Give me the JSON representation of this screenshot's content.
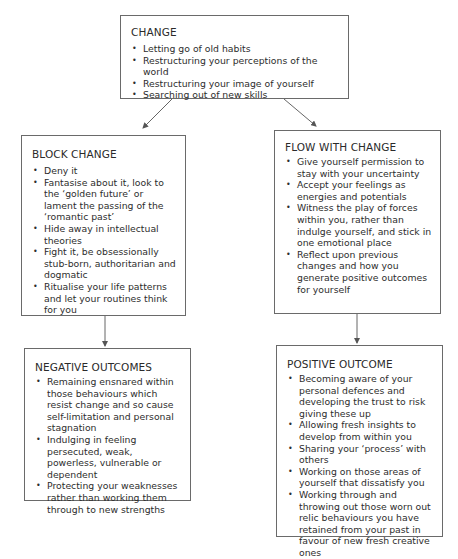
{
  "diagram": {
    "nodes": {
      "change": {
        "title": "CHANGE",
        "items": [
          "Letting go of old habits",
          "Restructuring your perceptions of the world",
          "Restructuring your image of yourself",
          "Searching out of new skills"
        ]
      },
      "block_change": {
        "title": "BLOCK CHANGE",
        "items": [
          "Deny it",
          "Fantasise about it, look to the ‘golden future’ or lament the passing of the ‘romantic past’",
          "Hide away in intellectual theories",
          "Fight it, be obsessionally stub-born, authoritarian and dogmatic",
          "Ritualise your life patterns and let your routines think for you"
        ]
      },
      "flow_with_change": {
        "title": "FLOW WITH CHANGE",
        "items": [
          "Give yourself permission to stay with your uncertainty",
          "Accept your feelings as energies and potentials",
          "Witness the play of forces within you, rather than indulge yourself, and stick in one emotional place",
          "Reflect upon previous changes and how you generate positive outcomes for yourself"
        ]
      },
      "negative_outcomes": {
        "title": "NEGATIVE OUTCOMES",
        "items": [
          "Remaining ensnared within those behaviours which resist change and so cause self-limitation and personal stagnation",
          "Indulging in feeling persecuted, weak, powerless, vulnerable or dependent",
          "Protecting your weaknesses rather than working them through to new strengths"
        ]
      },
      "positive_outcome": {
        "title": "POSITIVE OUTCOME",
        "items": [
          "Becoming aware of your personal defences and developing the trust to risk giving these up",
          "Allowing fresh insights to develop from within you",
          "Sharing your ‘process’ with others",
          "Working on those areas of yourself that dissatisfy you",
          "Working through and throwing out those worn out relic behaviours you have retained from your past in favour of new fresh creative ones"
        ]
      }
    },
    "edges": [
      {
        "from": "change",
        "to": "block_change"
      },
      {
        "from": "change",
        "to": "flow_with_change"
      },
      {
        "from": "block_change",
        "to": "negative_outcomes"
      },
      {
        "from": "flow_with_change",
        "to": "positive_outcome"
      }
    ],
    "colors": {
      "border": "#6a6a6a",
      "text": "#2a2a2a",
      "arrow": "#555555",
      "background": "#ffffff"
    }
  }
}
